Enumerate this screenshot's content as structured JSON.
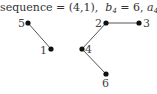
{
  "caption": {
    "prefix": "sequence = (4,1),",
    "b_var": "b",
    "b_sub": "4",
    "b_eq": " = 6, ",
    "a_var": "a",
    "a_sub": "4",
    "a_eq": " = 4"
  },
  "colors": {
    "node": "#111111",
    "edge": "#555555",
    "text": "#333333"
  },
  "graph": {
    "nodes": [
      {
        "id": "5",
        "label": "5",
        "x": 28,
        "y": 23
      },
      {
        "id": "1",
        "label": "1",
        "x": 51,
        "y": 49
      },
      {
        "id": "2",
        "label": "2",
        "x": 106,
        "y": 23
      },
      {
        "id": "3",
        "label": "3",
        "x": 139,
        "y": 23
      },
      {
        "id": "4",
        "label": "4",
        "x": 82,
        "y": 49
      },
      {
        "id": "6",
        "label": "6",
        "x": 106,
        "y": 74
      }
    ],
    "edges": [
      {
        "from": "5",
        "to": "1"
      },
      {
        "from": "2",
        "to": "3"
      },
      {
        "from": "2",
        "to": "4"
      },
      {
        "from": "4",
        "to": "6"
      }
    ]
  }
}
